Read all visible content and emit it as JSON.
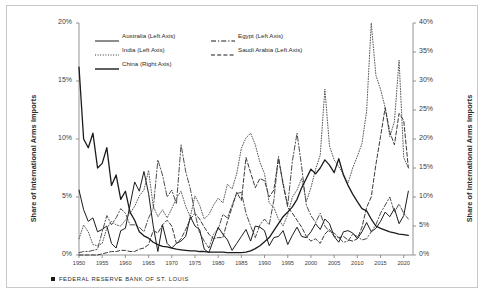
{
  "chart_data": {
    "type": "line",
    "title": "",
    "subtitle": "",
    "xlabel": "",
    "ylabel": "Share of International Arms Imports",
    "ylabel_right": "Share of International Arms Imports",
    "xlim": [
      1950,
      2022
    ],
    "ylim": [
      0,
      20
    ],
    "ylim_right": [
      0,
      40
    ],
    "grid": false,
    "legend_position": "top-left-inside",
    "xtick_labels": [
      "1950",
      "1955",
      "1960",
      "1965",
      "1970",
      "1975",
      "1980",
      "1985",
      "1990",
      "1995",
      "2000",
      "2005",
      "2010",
      "2015",
      "2020"
    ],
    "xtick_values": [
      1950,
      1955,
      1960,
      1965,
      1970,
      1975,
      1980,
      1985,
      1990,
      1995,
      2000,
      2005,
      2010,
      2015,
      2020
    ],
    "ytick_labels_left": [
      "0%",
      "5%",
      "10%",
      "15%",
      "20%"
    ],
    "ytick_values_left": [
      0,
      5,
      10,
      15,
      20
    ],
    "ytick_labels_right": [
      "0%",
      "5%",
      "10%",
      "15%",
      "20%",
      "25%",
      "30%",
      "35%",
      "40%"
    ],
    "ytick_values_right": [
      0,
      5,
      10,
      15,
      20,
      25,
      30,
      35,
      40
    ],
    "x": [
      1950,
      1951,
      1952,
      1953,
      1954,
      1955,
      1956,
      1957,
      1958,
      1959,
      1960,
      1961,
      1962,
      1963,
      1964,
      1965,
      1966,
      1967,
      1968,
      1969,
      1970,
      1971,
      1972,
      1973,
      1974,
      1975,
      1976,
      1977,
      1978,
      1979,
      1980,
      1981,
      1982,
      1983,
      1984,
      1985,
      1986,
      1987,
      1988,
      1989,
      1990,
      1991,
      1992,
      1993,
      1994,
      1995,
      1996,
      1997,
      1998,
      1999,
      2000,
      2001,
      2002,
      2003,
      2004,
      2005,
      2006,
      2007,
      2008,
      2009,
      2010,
      2011,
      2012,
      2013,
      2014,
      2015,
      2016,
      2017,
      2018,
      2019,
      2020,
      2021
    ],
    "series": [
      {
        "name": "Australia (Left Axis)",
        "axis": "left",
        "style": "solid",
        "color": "#1b1b1b",
        "width": 1.0,
        "values": [
          5.6,
          3.9,
          2.9,
          3.2,
          2.0,
          2.2,
          2.5,
          1.0,
          0.6,
          2.1,
          2.3,
          4.3,
          6.3,
          5.5,
          7.2,
          5.3,
          2.5,
          0.3,
          2.6,
          1.0,
          0.6,
          1.0,
          1.2,
          1.6,
          3.3,
          2.5,
          2.2,
          0.5,
          0.2,
          1.3,
          2.4,
          1.8,
          1.3,
          0.4,
          1.0,
          1.6,
          2.2,
          1.2,
          2.5,
          2.4,
          2.1,
          0.8,
          1.5,
          1.6,
          2.1,
          0.9,
          1.7,
          2.4,
          1.6,
          1.5,
          2.0,
          2.7,
          2.2,
          3.1,
          2.7,
          1.6,
          1.1,
          2.0,
          2.1,
          1.9,
          1.4,
          2.0,
          2.8,
          2.0,
          2.3,
          2.9,
          3.7,
          3.3,
          4.0,
          2.7,
          3.4,
          5.5
        ]
      },
      {
        "name": "Egypt (Left Axis)",
        "axis": "left",
        "style": "dashdot",
        "color": "#3a3a3a",
        "width": 0.9,
        "values": [
          0.2,
          0.3,
          0.3,
          0.4,
          0.5,
          2.0,
          3.4,
          2.6,
          3.2,
          4.0,
          3.6,
          2.6,
          2.6,
          2.4,
          2.0,
          3.2,
          4.0,
          8.2,
          6.9,
          5.0,
          5.6,
          4.4,
          9.5,
          7.2,
          5.7,
          3.6,
          1.9,
          1.2,
          0.6,
          1.8,
          2.2,
          3.5,
          3.2,
          4.3,
          5.3,
          5.4,
          3.6,
          2.5,
          1.5,
          2.6,
          3.1,
          2.6,
          4.7,
          8.5,
          6.0,
          4.3,
          8.1,
          10.5,
          7.6,
          4.3,
          3.4,
          2.8,
          3.6,
          2.5,
          2.0,
          1.9,
          1.5,
          1.1,
          1.2,
          1.8,
          1.6,
          1.3,
          1.4,
          2.0,
          2.6,
          3.6,
          4.3,
          5.0,
          3.7,
          4.4,
          3.6,
          3.1
        ]
      },
      {
        "name": "India (Left Axis)",
        "axis": "left",
        "style": "dotted",
        "color": "#5a5a5a",
        "width": 1.0,
        "values": [
          1.4,
          2.6,
          2.0,
          0.9,
          0.8,
          1.0,
          2.3,
          2.9,
          2.6,
          2.5,
          3.0,
          3.6,
          4.2,
          5.1,
          5.6,
          7.3,
          4.2,
          3.3,
          3.9,
          3.2,
          4.0,
          4.9,
          5.5,
          4.2,
          3.3,
          5.1,
          4.3,
          3.1,
          3.5,
          4.3,
          4.9,
          4.5,
          6.1,
          5.7,
          7.0,
          9.2,
          10.1,
          10.5,
          9.5,
          8.0,
          7.0,
          4.5,
          4.1,
          3.1,
          2.5,
          3.5,
          5.0,
          5.6,
          6.6,
          4.6,
          5.8,
          7.4,
          8.6,
          14.3,
          9.4,
          8.2,
          7.6,
          7.0,
          6.2,
          7.5,
          8.5,
          9.6,
          12.4,
          20.0,
          15.5,
          14.3,
          12.7,
          10.2,
          11.5,
          16.8,
          8.4,
          7.5
        ]
      },
      {
        "name": "Saudi Arabia (Left Axis)",
        "axis": "left",
        "style": "dashed",
        "color": "#3a3a3a",
        "width": 1.0,
        "values": [
          0.0,
          0.0,
          0.0,
          0.0,
          0.0,
          0.1,
          0.2,
          0.3,
          0.3,
          0.4,
          0.4,
          0.3,
          0.3,
          0.5,
          0.6,
          0.9,
          2.1,
          1.9,
          2.6,
          3.0,
          2.5,
          1.0,
          1.4,
          2.2,
          3.1,
          3.6,
          3.1,
          2.4,
          1.8,
          1.4,
          1.5,
          1.5,
          2.9,
          4.1,
          5.4,
          4.7,
          8.4,
          7.1,
          5.8,
          6.6,
          6.4,
          5.0,
          5.6,
          8.3,
          6.2,
          4.1,
          3.6,
          3.0,
          2.4,
          1.6,
          1.2,
          1.4,
          1.0,
          1.8,
          2.2,
          1.6,
          1.5,
          1.6,
          1.3,
          1.2,
          1.4,
          2.4,
          4.1,
          5.0,
          7.8,
          10.2,
          12.7,
          10.6,
          9.5,
          12.2,
          11.6,
          7.5
        ]
      },
      {
        "name": "China (Right Axis)",
        "axis": "right",
        "style": "solid",
        "color": "#1b1b1b",
        "width": 1.3,
        "values": [
          32.4,
          20.0,
          18.5,
          21.0,
          15.0,
          15.8,
          18.5,
          12.0,
          13.8,
          9.6,
          11.0,
          7.4,
          6.0,
          4.0,
          3.3,
          2.9,
          2.2,
          1.8,
          1.5,
          1.4,
          1.2,
          1.0,
          0.9,
          0.8,
          0.7,
          0.7,
          0.6,
          0.6,
          0.5,
          0.5,
          0.5,
          0.5,
          0.4,
          0.4,
          0.4,
          0.4,
          0.5,
          0.7,
          1.1,
          1.6,
          2.3,
          3.0,
          4.2,
          5.4,
          6.6,
          7.4,
          8.3,
          9.6,
          11.6,
          13.2,
          14.8,
          14.0,
          15.0,
          16.4,
          15.5,
          14.2,
          16.6,
          13.8,
          12.0,
          10.5,
          9.2,
          8.0,
          7.6,
          6.2,
          5.0,
          4.6,
          4.3,
          4.0,
          3.8,
          3.6,
          3.5,
          3.4
        ]
      }
    ]
  },
  "legend": {
    "rows": [
      {
        "entries": [
          {
            "label": "Australia (Left Axis)",
            "style": "solid"
          },
          {
            "label": "Egypt  (Left Axis)",
            "style": "dashdot"
          }
        ]
      },
      {
        "entries": [
          {
            "label": "India  (Left Axis)",
            "style": "dotted"
          },
          {
            "label": "Saudi Arabia  (Left Axis)",
            "style": "dashed"
          }
        ]
      },
      {
        "entries": [
          {
            "label": "China (Right Axis)",
            "style": "solid-thick"
          }
        ]
      }
    ]
  },
  "source": {
    "text": "FEDERAL RESERVE BANK OF ST. LOUIS"
  },
  "colors": {
    "line": "#1b1b1b",
    "frame": "#c9c9c9",
    "axis": "#7a7a7a",
    "text": "#2b2b2b"
  }
}
